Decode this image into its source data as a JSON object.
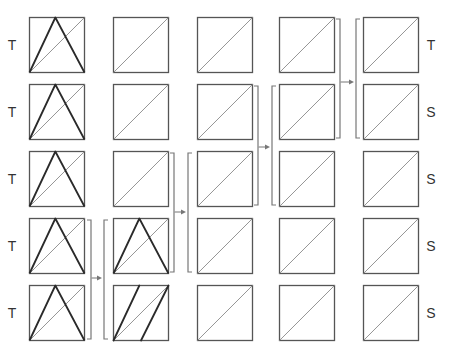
{
  "diagram": {
    "colors": {
      "box_stroke": "#555555",
      "diagonal_stroke": "#8a8a8a",
      "shape_stroke": "#2a2a2a",
      "bracket_stroke": "#777777",
      "arrow_color": "#777777",
      "label_color": "#333333"
    },
    "columns_x": [
      29,
      113,
      197,
      279,
      363
    ],
    "rows_y": [
      17,
      84,
      151,
      218,
      285
    ],
    "box_size": 55,
    "left_labels": [
      "T",
      "T",
      "T",
      "T",
      "T"
    ],
    "right_labels": [
      "T",
      "S",
      "S",
      "S",
      "S"
    ],
    "cells": [
      [
        "triangle",
        "diagonal",
        "diagonal",
        "diagonal",
        "diagonal"
      ],
      [
        "triangle",
        "diagonal",
        "diagonal",
        "diagonal",
        "diagonal"
      ],
      [
        "triangle",
        "diagonal",
        "diagonal",
        "diagonal",
        "diagonal"
      ],
      [
        "triangle",
        "triangle",
        "diagonal",
        "diagonal",
        "diagonal"
      ],
      [
        "triangle",
        "parallelogram",
        "diagonal",
        "diagonal",
        "diagonal"
      ]
    ],
    "merges": [
      {
        "from_col": 0,
        "to_col": 1,
        "rows": [
          3,
          4
        ],
        "close_x": 91,
        "open_x": 104,
        "arrow_y": 278
      },
      {
        "from_col": 1,
        "to_col": 2,
        "rows": [
          2,
          3
        ],
        "close_x": 174,
        "open_x": 188,
        "arrow_y": 212
      },
      {
        "from_col": 2,
        "to_col": 3,
        "rows": [
          1,
          2
        ],
        "close_x": 258,
        "open_x": 272,
        "arrow_y": 147
      },
      {
        "from_col": 3,
        "to_col": 4,
        "rows": [
          0,
          1
        ],
        "close_x": 340,
        "open_x": 356,
        "arrow_y": 82
      }
    ]
  }
}
